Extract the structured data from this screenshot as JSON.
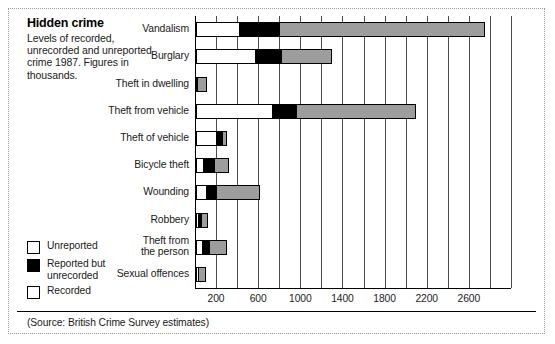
{
  "title": "Hidden crime",
  "subtitle": "Levels of recorded, unrecorded and unreported crime 1987. Figures in thousands.",
  "source": "(Source: British Crime Survey estimates)",
  "legend": {
    "items": [
      {
        "label": "Unreported",
        "color": "#ffffff",
        "key": "unreported"
      },
      {
        "label": "Reported but\nunrecorded",
        "color": "#000000",
        "key": "reported"
      },
      {
        "label": "Recorded",
        "color": "#9d9d9d",
        "key": "recorded"
      }
    ]
  },
  "chart_data": {
    "type": "bar",
    "orientation": "horizontal",
    "stacked": true,
    "title": "Hidden crime",
    "subtitle": "Levels of recorded, unrecorded and unreported crime 1987. Figures in thousands.",
    "xlabel": "",
    "ylabel": "",
    "xlim": [
      0,
      3000
    ],
    "xticks": [
      200,
      600,
      1000,
      1400,
      1800,
      2200,
      2600
    ],
    "gridlines_every": 200,
    "grid": true,
    "legend_position": "bottom-left",
    "units": "thousands",
    "categories": [
      "Vandalism",
      "Burglary",
      "Theft in dwelling",
      "Theft from vehicle",
      "Theft of vehicle",
      "Bicycle theft",
      "Wounding",
      "Robbery",
      "Theft from\nthe person",
      "Sexual offences"
    ],
    "series": [
      {
        "name": "Unreported",
        "color": "#ffffff",
        "values": [
          420,
          570,
          20,
          730,
          200,
          80,
          100,
          30,
          70,
          25
        ]
      },
      {
        "name": "Reported but unrecorded",
        "color": "#000000",
        "values": [
          380,
          250,
          0,
          230,
          55,
          100,
          95,
          25,
          65,
          0
        ]
      },
      {
        "name": "Recorded",
        "color": "#9d9d9d",
        "values": [
          1940,
          470,
          80,
          1130,
          35,
          130,
          410,
          55,
          160,
          70
        ]
      }
    ],
    "totals": [
      2740,
      1290,
      100,
      2090,
      290,
      310,
      605,
      110,
      295,
      95
    ]
  }
}
